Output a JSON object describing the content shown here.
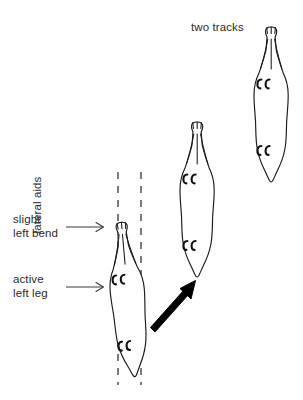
{
  "figure": {
    "title_label": "two tracks",
    "background_color": "#ffffff",
    "ink_color": "#1a1a1a",
    "text_color": "#2b2b2b",
    "width": 303,
    "height": 400
  },
  "annotations": {
    "two_tracks": "two tracks",
    "lateral_aids": "lateral aids",
    "slight_left_bend": "slight\nleft bend",
    "slight_left_bend_line1": "slight",
    "slight_left_bend_line2": "left bend",
    "active_left_leg": "active\nleft leg",
    "active_left_leg_line1": "active",
    "active_left_leg_line2": "left leg"
  },
  "horses": [
    {
      "id": "horse-start",
      "name": "horse-figure-start",
      "position": "bottom-left",
      "bend": "slight left bend",
      "on_tracks": "single track between lateral aid lines",
      "hoofprints": 4
    },
    {
      "id": "horse-middle",
      "name": "horse-figure-middle",
      "position": "center",
      "bend": "straight",
      "hoofprints": 4
    },
    {
      "id": "horse-end",
      "name": "horse-figure-end",
      "position": "top-right",
      "bend": "straight",
      "hoofprints": 4
    }
  ],
  "track_lines": {
    "count": 2,
    "style": "dashed",
    "label": "lateral aids"
  },
  "movement_arrow": {
    "name": "movement-direction-arrow",
    "direction": "up-right",
    "style": "solid bold"
  },
  "pointer_arrows": [
    {
      "name": "pointer-slight-left-bend",
      "target": "horse-figure-start"
    },
    {
      "name": "pointer-active-left-leg",
      "target": "horse-figure-start"
    }
  ]
}
